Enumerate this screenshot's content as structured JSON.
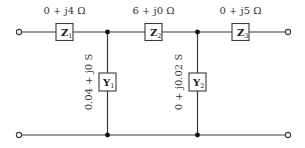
{
  "circuit": {
    "series_elements": [
      {
        "symbol": "Z",
        "subscript": "1",
        "value": "0 + j4 Ω"
      },
      {
        "symbol": "Z",
        "subscript": "2",
        "value": "6 + j0 Ω"
      },
      {
        "symbol": "Z",
        "subscript": "3",
        "value": "0 + j5 Ω"
      }
    ],
    "shunt_elements": [
      {
        "symbol": "Y",
        "subscript": "1",
        "value": "0.04 + j0 S"
      },
      {
        "symbol": "Y",
        "subscript": "2",
        "value": "0 + j0.02 S"
      }
    ],
    "colors": {
      "wire": "#3a3a3a",
      "node": "#111111",
      "text": "#333333"
    }
  }
}
